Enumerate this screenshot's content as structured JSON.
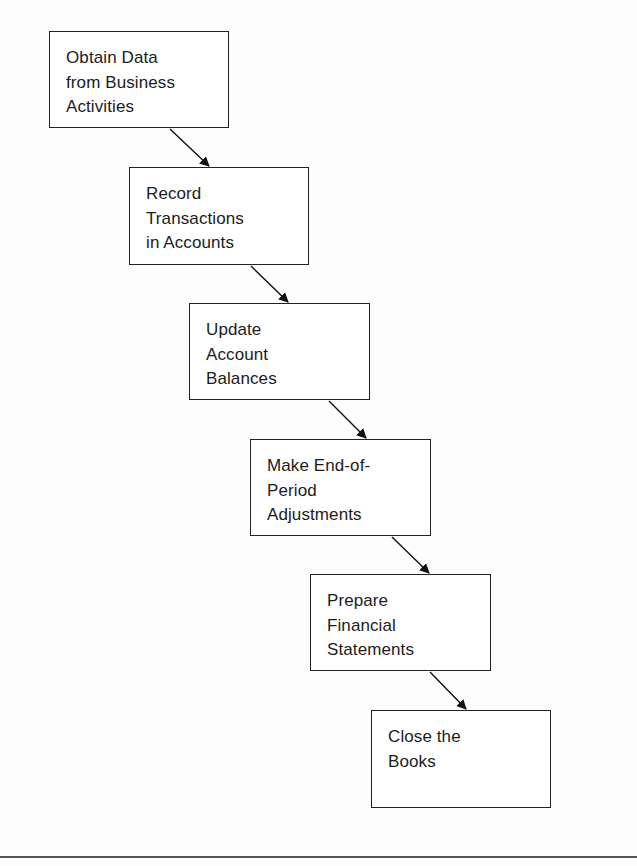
{
  "diagram": {
    "type": "flowchart",
    "direction": "diagonal-top-left-to-bottom-right",
    "steps": [
      {
        "id": 1,
        "label": "Obtain Data\nfrom Business\nActivities"
      },
      {
        "id": 2,
        "label": "Record\nTransactions\nin Accounts"
      },
      {
        "id": 3,
        "label": "Update\nAccount\nBalances"
      },
      {
        "id": 4,
        "label": "Make End-of-\nPeriod\nAdjustments"
      },
      {
        "id": 5,
        "label": "Prepare\nFinancial\nStatements"
      },
      {
        "id": 6,
        "label": "Close the\nBooks"
      }
    ],
    "connections": [
      {
        "from": 1,
        "to": 2
      },
      {
        "from": 2,
        "to": 3
      },
      {
        "from": 3,
        "to": 4
      },
      {
        "from": 4,
        "to": 5
      },
      {
        "from": 5,
        "to": 6
      }
    ],
    "colors": {
      "border": "#222222",
      "arrow": "#111111",
      "text": "#1c1c1c",
      "background": "#ffffff"
    }
  }
}
